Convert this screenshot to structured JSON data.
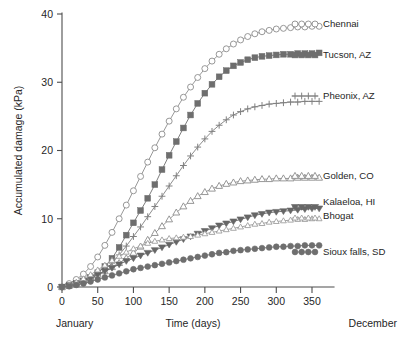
{
  "chart_data": {
    "type": "line",
    "title": "",
    "xlabel": "Time (days)",
    "ylabel": "Accumulated damage (kPa)",
    "xlim": [
      0,
      365
    ],
    "ylim": [
      0,
      40
    ],
    "xticks": [
      0,
      50,
      100,
      150,
      200,
      250,
      300,
      350
    ],
    "xtick_labels": [
      "0",
      "50",
      "100",
      "150",
      "200",
      "250",
      "300",
      "350"
    ],
    "yticks": [
      0,
      10,
      20,
      30,
      40
    ],
    "ytick_labels": [
      "0",
      "10",
      "20",
      "30",
      "40"
    ],
    "grid": false,
    "legend_position": "right-outside",
    "x_start_label": "January",
    "x_end_label": "December",
    "x": [
      0,
      10,
      20,
      30,
      40,
      50,
      60,
      70,
      80,
      90,
      100,
      110,
      120,
      130,
      140,
      150,
      160,
      170,
      180,
      190,
      200,
      210,
      220,
      230,
      240,
      250,
      260,
      270,
      280,
      290,
      300,
      310,
      320,
      330,
      340,
      350,
      360
    ],
    "series": [
      {
        "name": "Chennai",
        "marker": "open-circle",
        "color": "#8c8c8c",
        "values": [
          0.0,
          0.5,
          1.1,
          1.9,
          3.0,
          4.4,
          6.1,
          8.0,
          10.0,
          12.0,
          14.1,
          16.2,
          18.3,
          20.4,
          22.4,
          24.3,
          26.1,
          27.8,
          29.3,
          30.7,
          32.0,
          33.1,
          34.1,
          34.9,
          35.6,
          36.2,
          36.7,
          37.1,
          37.4,
          37.6,
          37.8,
          37.9,
          38.0,
          38.1,
          38.1,
          38.2,
          38.2
        ]
      },
      {
        "name": "Tucson, AZ",
        "marker": "filled-square",
        "color": "#6e6e6e",
        "values": [
          0.0,
          0.2,
          0.5,
          0.9,
          1.4,
          2.1,
          3.0,
          4.2,
          5.8,
          7.6,
          9.4,
          11.2,
          13.0,
          15.0,
          17.2,
          19.3,
          21.3,
          23.3,
          25.2,
          26.9,
          28.4,
          29.7,
          30.8,
          31.7,
          32.4,
          32.9,
          33.3,
          33.6,
          33.8,
          33.9,
          34.0,
          34.1,
          34.1,
          34.2,
          34.2,
          34.2,
          34.3
        ]
      },
      {
        "name": "Pheonix, AZ",
        "marker": "plus",
        "color": "#808080",
        "values": [
          0.0,
          0.2,
          0.4,
          0.7,
          1.1,
          1.7,
          2.5,
          3.5,
          4.7,
          6.0,
          7.4,
          8.8,
          10.3,
          11.8,
          13.3,
          14.8,
          16.3,
          17.8,
          19.2,
          20.5,
          21.7,
          22.8,
          23.7,
          24.5,
          25.2,
          25.7,
          26.1,
          26.4,
          26.6,
          26.8,
          26.9,
          27.0,
          27.1,
          27.1,
          27.2,
          27.2,
          27.2
        ]
      },
      {
        "name": "Golden, CO",
        "marker": "open-triangle-up",
        "color": "#8c8c8c",
        "values": [
          0.0,
          0.2,
          0.5,
          0.9,
          1.3,
          1.8,
          2.3,
          2.9,
          3.5,
          4.2,
          5.0,
          5.9,
          6.9,
          7.9,
          8.9,
          9.9,
          10.9,
          11.8,
          12.6,
          13.3,
          13.9,
          14.4,
          14.8,
          15.1,
          15.3,
          15.5,
          15.6,
          15.7,
          15.8,
          15.8,
          15.9,
          15.9,
          15.9,
          16.0,
          16.0,
          16.0,
          16.0
        ]
      },
      {
        "name": "Kalaeloa, HI",
        "marker": "filled-triangle-down",
        "color": "#666666",
        "values": [
          0.0,
          0.2,
          0.5,
          0.9,
          1.3,
          1.8,
          2.3,
          2.8,
          3.3,
          3.8,
          4.2,
          4.6,
          5.0,
          5.4,
          5.8,
          6.2,
          6.6,
          7.0,
          7.4,
          7.8,
          8.2,
          8.6,
          9.0,
          9.3,
          9.6,
          9.9,
          10.2,
          10.5,
          10.7,
          10.9,
          11.0,
          11.1,
          11.2,
          11.3,
          11.4,
          11.5,
          11.5
        ]
      },
      {
        "name": "Bhogat",
        "marker": "open-triangle-up-small",
        "color": "#999999",
        "values": [
          0.0,
          0.3,
          0.7,
          1.2,
          1.8,
          2.5,
          3.2,
          3.9,
          4.5,
          5.1,
          5.6,
          6.0,
          6.4,
          6.7,
          6.9,
          7.1,
          7.2,
          7.3,
          7.4,
          7.6,
          7.8,
          8.0,
          8.2,
          8.4,
          8.6,
          8.8,
          9.0,
          9.2,
          9.3,
          9.5,
          9.6,
          9.7,
          9.8,
          9.9,
          9.9,
          10.0,
          10.0
        ]
      },
      {
        "name": "Sioux falls, SD",
        "marker": "filled-circle",
        "color": "#6e6e6e",
        "values": [
          0.0,
          0.1,
          0.3,
          0.5,
          0.8,
          1.1,
          1.4,
          1.7,
          2.0,
          2.3,
          2.6,
          2.8,
          3.0,
          3.2,
          3.4,
          3.6,
          3.8,
          4.0,
          4.2,
          4.4,
          4.6,
          4.8,
          5.0,
          5.1,
          5.3,
          5.4,
          5.5,
          5.6,
          5.7,
          5.8,
          5.9,
          5.9,
          6.0,
          6.0,
          6.1,
          6.1,
          6.1
        ]
      }
    ]
  }
}
